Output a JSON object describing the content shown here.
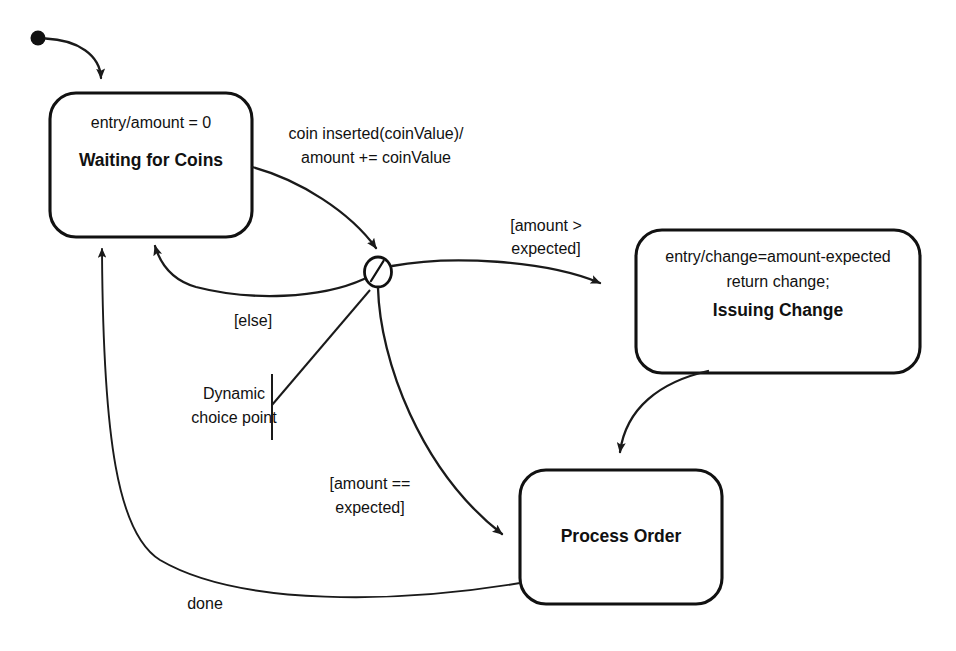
{
  "diagram": {
    "type": "uml-state-machine",
    "background_color": "#ffffff",
    "line_color": "#1a1a1a"
  },
  "initial_state": {
    "name": "initial-pseudostate"
  },
  "states": [
    {
      "id": "waiting",
      "name": "Waiting for Coins",
      "activities": [
        "entry/amount = 0"
      ]
    },
    {
      "id": "issuing",
      "name": "Issuing Change",
      "activities": [
        "entry/change=amount-expected",
        "return change;"
      ]
    },
    {
      "id": "process",
      "name": "Process Order",
      "activities": []
    }
  ],
  "choice_point": {
    "annotation_line1": "Dynamic",
    "annotation_line2": "choice point"
  },
  "transitions": [
    {
      "id": "coin-inserted",
      "from": "waiting",
      "to": "choice",
      "label_line1": "coin inserted(coinValue)/",
      "label_line2": "amount += coinValue"
    },
    {
      "id": "else-branch",
      "from": "choice",
      "to": "waiting",
      "label_line1": "[else]",
      "label_line2": ""
    },
    {
      "id": "amount-greater",
      "from": "choice",
      "to": "issuing",
      "label_line1": "[amount >",
      "label_line2": "expected]"
    },
    {
      "id": "amount-equal",
      "from": "choice",
      "to": "process",
      "label_line1": "[amount ==",
      "label_line2": "expected]"
    },
    {
      "id": "issuing-to-process",
      "from": "issuing",
      "to": "process",
      "label_line1": "",
      "label_line2": ""
    },
    {
      "id": "done",
      "from": "process",
      "to": "waiting",
      "label_line1": "done",
      "label_line2": ""
    }
  ]
}
